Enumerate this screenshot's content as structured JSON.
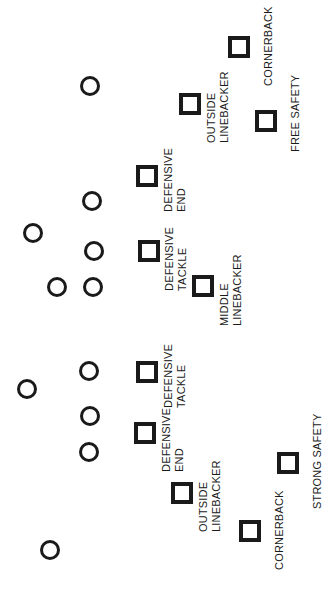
{
  "diagram": {
    "width": 332,
    "height": 593,
    "background_color": "#ffffff",
    "marker_color": "#1a1a1a"
  },
  "offense": {
    "marker_shape": "circle",
    "label": "Offensive player",
    "players": [
      {
        "id": "o1",
        "x": 90,
        "y": 86,
        "r": 10
      },
      {
        "id": "o2",
        "x": 92,
        "y": 201,
        "r": 10
      },
      {
        "id": "o3",
        "x": 33,
        "y": 233,
        "r": 10
      },
      {
        "id": "o4",
        "x": 94,
        "y": 251,
        "r": 10
      },
      {
        "id": "o5",
        "x": 57,
        "y": 287,
        "r": 10
      },
      {
        "id": "o6",
        "x": 93,
        "y": 287,
        "r": 10
      },
      {
        "id": "o7",
        "x": 89,
        "y": 371,
        "r": 10
      },
      {
        "id": "o8",
        "x": 27,
        "y": 389,
        "r": 10
      },
      {
        "id": "o9",
        "x": 90,
        "y": 416,
        "r": 10
      },
      {
        "id": "o10",
        "x": 89,
        "y": 452,
        "r": 10
      },
      {
        "id": "o11",
        "x": 50,
        "y": 550,
        "r": 10
      }
    ]
  },
  "defense": {
    "marker_shape": "square",
    "label": "Defensive player",
    "players": [
      {
        "id": "d-cb-top",
        "position": "CORNERBACK",
        "lines": [
          "CORNERBACK"
        ],
        "x": 228,
        "y": 36,
        "size": 22,
        "label_x": 262,
        "label_y": 86
      },
      {
        "id": "d-olb-top",
        "position": "OUTSIDE LINEBACKER",
        "lines": [
          "OUTSIDE",
          "LINEBACKER"
        ],
        "x": 179,
        "y": 93,
        "size": 22,
        "label_x": 205,
        "label_y": 143
      },
      {
        "id": "d-fs",
        "position": "FREE SAFETY",
        "lines": [
          "FREE SAFETY"
        ],
        "x": 255,
        "y": 110,
        "size": 22,
        "label_x": 289,
        "label_y": 152
      },
      {
        "id": "d-de-top",
        "position": "DEFENSIVE END",
        "lines": [
          "DEFENSIVE",
          "END"
        ],
        "x": 136,
        "y": 165,
        "size": 22,
        "label_x": 162,
        "label_y": 212
      },
      {
        "id": "d-dt-top",
        "position": "DEFENSIVE TACKLE",
        "lines": [
          "DEFENSIVE",
          "TACKLE"
        ],
        "x": 138,
        "y": 240,
        "size": 22,
        "label_x": 163,
        "label_y": 291
      },
      {
        "id": "d-mlb",
        "position": "MIDDLE LINEBACKER",
        "lines": [
          "MIDDLE",
          "LINEBACKER"
        ],
        "x": 192,
        "y": 275,
        "size": 22,
        "label_x": 218,
        "label_y": 326
      },
      {
        "id": "d-dt-bottom",
        "position": "DEFENSIVE TACKLE",
        "lines": [
          "DEFENSIVE",
          "TACKLE"
        ],
        "x": 136,
        "y": 361,
        "size": 22,
        "label_x": 162,
        "label_y": 408
      },
      {
        "id": "d-de-bottom",
        "position": "DEFENSIVE END",
        "lines": [
          "DEFENSIVE",
          "END"
        ],
        "x": 134,
        "y": 422,
        "size": 22,
        "label_x": 160,
        "label_y": 472
      },
      {
        "id": "d-olb-bottom",
        "position": "OUTSIDE LINEBACKER",
        "lines": [
          "OUTSIDE",
          "LINEBACKER"
        ],
        "x": 171,
        "y": 482,
        "size": 22,
        "label_x": 197,
        "label_y": 532
      },
      {
        "id": "d-ss",
        "position": "STRONG SAFETY",
        "lines": [
          "STRONG SAFETY"
        ],
        "x": 277,
        "y": 452,
        "size": 22,
        "label_x": 311,
        "label_y": 509
      },
      {
        "id": "d-cb-bottom",
        "position": "CORNERBACK",
        "lines": [
          "CORNERBACK"
        ],
        "x": 239,
        "y": 520,
        "size": 22,
        "label_x": 273,
        "label_y": 570
      }
    ]
  }
}
